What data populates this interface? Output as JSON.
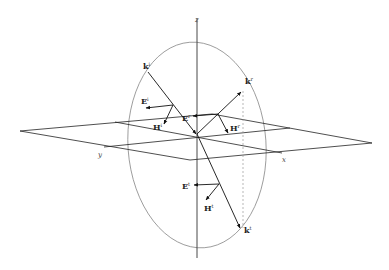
{
  "diagram": {
    "axes": {
      "x": "x",
      "y": "y",
      "z": "z"
    },
    "vectors": {
      "k_incident": {
        "base": "k",
        "sup": "i"
      },
      "k_reflected": {
        "base": "k",
        "sup": "r"
      },
      "k_transmitted": {
        "base": "k",
        "sup": "t"
      },
      "E_incident": {
        "base": "E",
        "sup": "i"
      },
      "H_incident": {
        "base": "H",
        "sup": "i"
      },
      "E_reflected": {
        "base": "E",
        "sup": "r"
      },
      "H_reflected": {
        "base": "H",
        "sup": "r"
      },
      "E_transmitted": {
        "base": "E",
        "sup": "t"
      },
      "H_transmitted": {
        "base": "H",
        "sup": "t"
      }
    },
    "colors": {
      "line": "#222222",
      "ellipse": "#888888",
      "dashed": "#999999"
    }
  }
}
